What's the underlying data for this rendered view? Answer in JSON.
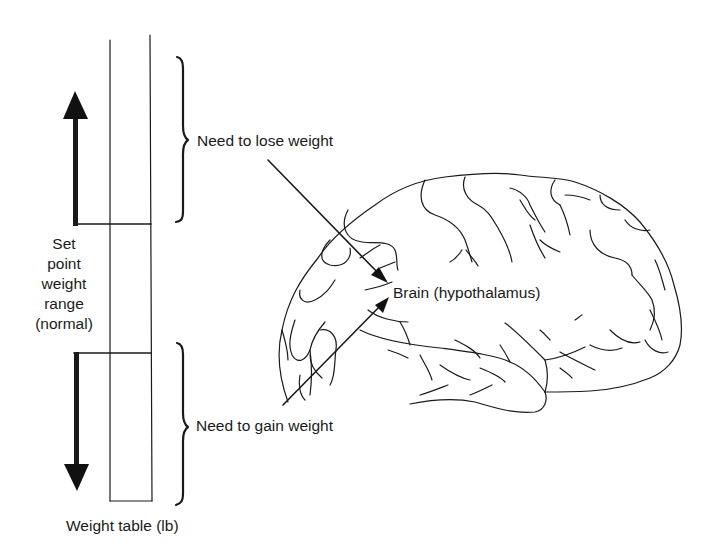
{
  "figure": {
    "type": "diagram",
    "colors": {
      "ink": "#1a1a1a",
      "background": "#ffffff"
    }
  },
  "weight_table": {
    "label": "Weight table (lb)",
    "set_point_label_lines": [
      "Set",
      "point",
      "weight",
      "range",
      "(normal)"
    ],
    "upper_arrow": "arrow-up",
    "lower_arrow": "arrow-down"
  },
  "signals": {
    "upper": {
      "label": "Need to lose weight",
      "brace": "right-curly-brace"
    },
    "lower": {
      "label": "Need to gain weight",
      "brace": "right-curly-brace"
    }
  },
  "brain": {
    "label": "Brain (hypothalamus)",
    "icon": "brain-outline"
  }
}
